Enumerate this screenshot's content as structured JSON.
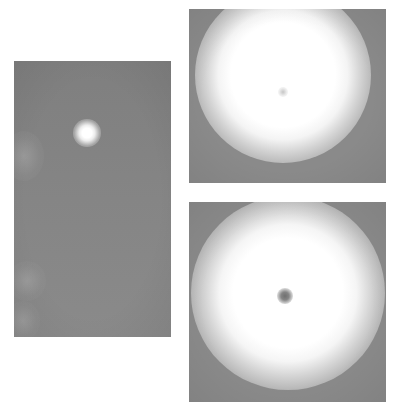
{
  "figure": {
    "panels": [
      {
        "id": "left",
        "description": "Wide view of sky with small bright sun and faint clouds at left edge",
        "colors": {
          "sky": "#858585",
          "sun": "#ffffff"
        }
      },
      {
        "id": "top-right",
        "description": "Close-up of bright solar disc with faint central spot",
        "colors": {
          "background": "#8a8a8a",
          "disc": "#ffffff"
        }
      },
      {
        "id": "bottom-right",
        "description": "Close-up of bright solar disc with dark central spot",
        "colors": {
          "background": "#8a8a8a",
          "disc": "#ffffff",
          "spot": "#707070"
        }
      }
    ]
  }
}
